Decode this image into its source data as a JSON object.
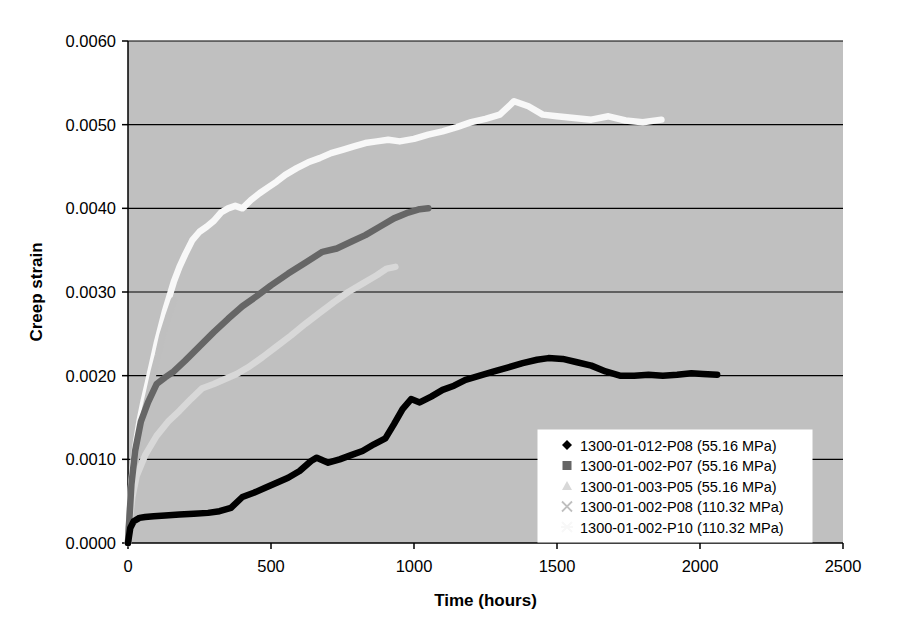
{
  "chart_data": {
    "type": "line",
    "title": "",
    "xlabel": "Time (hours)",
    "ylabel": "Creep strain",
    "xlim": [
      0,
      2500
    ],
    "ylim": [
      0.0,
      0.006
    ],
    "xticks": [
      0,
      500,
      1000,
      1500,
      2000,
      2500
    ],
    "xtick_labels": [
      "0",
      "500",
      "1000",
      "1500",
      "2000",
      "2500"
    ],
    "yticks": [
      0.0,
      0.001,
      0.002,
      0.003,
      0.004,
      0.005,
      0.006
    ],
    "ytick_labels": [
      "0.0000",
      "0.0010",
      "0.0020",
      "0.0030",
      "0.0040",
      "0.0050",
      "0.0060"
    ],
    "grid": "horizontal",
    "plot_background": "#c0c0c0",
    "legend_position": "lower-right",
    "series": [
      {
        "name": "1300-01-012-P08 (55.16 MPa)",
        "marker": "diamond",
        "color": "#000000",
        "x": [
          0,
          8,
          20,
          40,
          60,
          90,
          130,
          180,
          230,
          280,
          320,
          360,
          400,
          440,
          480,
          520,
          560,
          600,
          640,
          660,
          700,
          740,
          780,
          820,
          860,
          900,
          930,
          960,
          990,
          1020,
          1060,
          1100,
          1140,
          1180,
          1230,
          1280,
          1330,
          1380,
          1430,
          1470,
          1520,
          1570,
          1620,
          1670,
          1720,
          1770,
          1820,
          1870,
          1920,
          1970,
          2010,
          2060
        ],
        "y": [
          0.0,
          0.00018,
          0.00026,
          0.0003,
          0.00031,
          0.00032,
          0.00033,
          0.00034,
          0.00035,
          0.00036,
          0.00038,
          0.00042,
          0.00055,
          0.0006,
          0.00066,
          0.00072,
          0.00078,
          0.00086,
          0.00098,
          0.00102,
          0.00096,
          0.001,
          0.00105,
          0.0011,
          0.00118,
          0.00125,
          0.00142,
          0.0016,
          0.00172,
          0.00168,
          0.00175,
          0.00183,
          0.00188,
          0.00195,
          0.002,
          0.00205,
          0.0021,
          0.00215,
          0.00219,
          0.00221,
          0.0022,
          0.00216,
          0.00212,
          0.00205,
          0.002,
          0.002,
          0.00201,
          0.002,
          0.00201,
          0.00203,
          0.00202,
          0.00201
        ]
      },
      {
        "name": "1300-01-002-P07 (55.16 MPa)",
        "marker": "square",
        "color": "#666666",
        "x": [
          0,
          5,
          12,
          25,
          45,
          70,
          100,
          130,
          160,
          200,
          250,
          300,
          350,
          400,
          450,
          500,
          560,
          620,
          680,
          730,
          780,
          830,
          880,
          930,
          980,
          1020,
          1050
        ],
        "y": [
          0.0,
          0.0003,
          0.0007,
          0.0011,
          0.00145,
          0.00168,
          0.0019,
          0.00198,
          0.00205,
          0.00218,
          0.00235,
          0.00252,
          0.00268,
          0.00283,
          0.00295,
          0.00308,
          0.00322,
          0.00335,
          0.00348,
          0.00352,
          0.0036,
          0.00368,
          0.00378,
          0.00388,
          0.00395,
          0.00399,
          0.004
        ]
      },
      {
        "name": "1300-01-003-P05 (55.16 MPa)",
        "marker": "triangle",
        "color": "#d8d8d8",
        "x": [
          0,
          5,
          15,
          30,
          60,
          100,
          140,
          180,
          220,
          260,
          300,
          340,
          380,
          420,
          470,
          520,
          570,
          620,
          670,
          720,
          770,
          820,
          870,
          905,
          935
        ],
        "y": [
          0.0,
          0.00025,
          0.00055,
          0.0008,
          0.00105,
          0.00128,
          0.00145,
          0.00158,
          0.00172,
          0.00185,
          0.0019,
          0.00196,
          0.00202,
          0.0021,
          0.00222,
          0.00235,
          0.00248,
          0.00262,
          0.00275,
          0.00288,
          0.003,
          0.0031,
          0.0032,
          0.00328,
          0.0033
        ]
      },
      {
        "name": "1300-01-002-P08 (110.32 MPa)",
        "marker": "x",
        "color": "#bfbfbf",
        "x": [
          0,
          3,
          8,
          15,
          25,
          35,
          45,
          60,
          75,
          90,
          105,
          120,
          140,
          160
        ],
        "y": [
          0.0,
          0.0002,
          0.00045,
          0.0007,
          0.00095,
          0.00115,
          0.00135,
          0.0016,
          0.00182,
          0.00205,
          0.00225,
          0.00248,
          0.0027,
          0.0029
        ]
      },
      {
        "name": "1300-01-002-P10 (110.32 MPa)",
        "marker": "star",
        "color": "#f8f8f8",
        "x": [
          0,
          4,
          10,
          18,
          28,
          40,
          55,
          70,
          85,
          100,
          115,
          130,
          145,
          160,
          180,
          200,
          225,
          250,
          275,
          300,
          325,
          350,
          375,
          400,
          430,
          460,
          490,
          520,
          550,
          590,
          630,
          670,
          710,
          750,
          790,
          830,
          870,
          910,
          950,
          1000,
          1050,
          1100,
          1150,
          1200,
          1250,
          1300,
          1350,
          1400,
          1450,
          1500,
          1560,
          1620,
          1680,
          1740,
          1800,
          1865
        ],
        "y": [
          0.0,
          0.0003,
          0.00065,
          0.00095,
          0.0012,
          0.00145,
          0.0017,
          0.00192,
          0.00215,
          0.00238,
          0.00258,
          0.00278,
          0.00295,
          0.00312,
          0.0033,
          0.00345,
          0.00362,
          0.00372,
          0.00378,
          0.00385,
          0.00395,
          0.004,
          0.00403,
          0.004,
          0.0041,
          0.00418,
          0.00425,
          0.00432,
          0.0044,
          0.00448,
          0.00455,
          0.0046,
          0.00466,
          0.0047,
          0.00474,
          0.00478,
          0.0048,
          0.00482,
          0.0048,
          0.00483,
          0.00488,
          0.00492,
          0.00497,
          0.00503,
          0.00507,
          0.00512,
          0.00528,
          0.00522,
          0.00512,
          0.0051,
          0.00508,
          0.00506,
          0.0051,
          0.00505,
          0.00503,
          0.00506
        ]
      }
    ]
  }
}
